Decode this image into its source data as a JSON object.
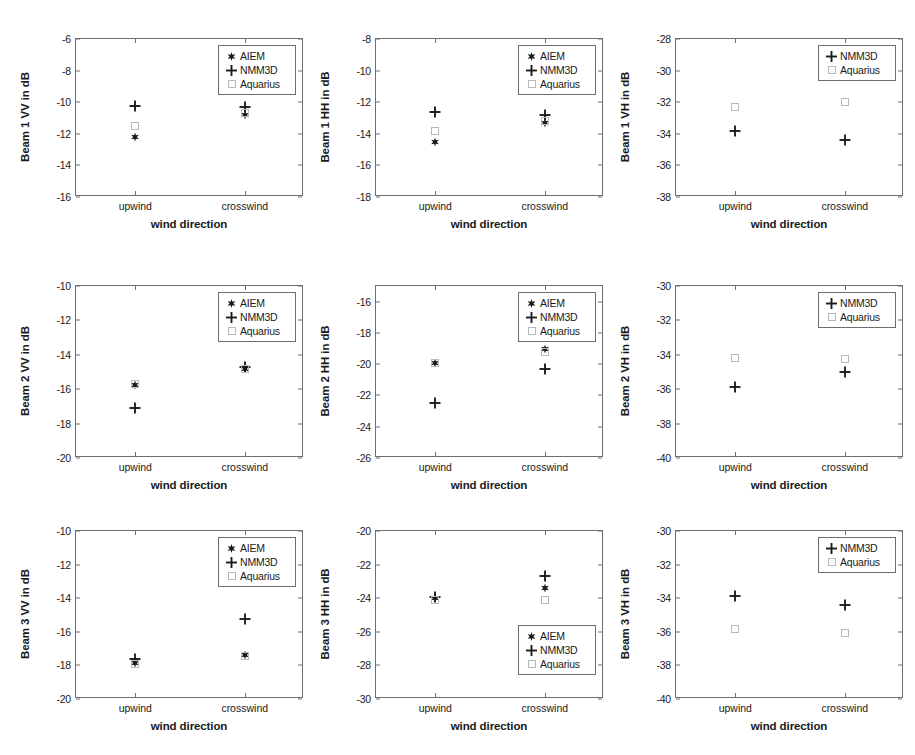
{
  "figure": {
    "xlabel": "wind direction",
    "xticks": [
      "upwind",
      "crosswind"
    ],
    "series_names": [
      "AIEM",
      "NMM3D",
      "Aquarius"
    ],
    "markers": {
      "AIEM": "star-marker",
      "NMM3D": "plus-marker",
      "Aquarius": "open-square-marker"
    },
    "colors": {
      "AIEM": "#1a1a1a",
      "NMM3D": "#1a1a1a",
      "Aquarius": "#b9b9b9",
      "axis": "#6e6e6e"
    }
  },
  "chart_data": [
    {
      "type": "scatter",
      "title": "",
      "ylabel": "Beam 1 VV in dB",
      "xlabel": "wind direction",
      "categories": [
        "upwind",
        "crosswind"
      ],
      "ylim": [
        -16,
        -6
      ],
      "yticks": [
        -6,
        -8,
        -10,
        -12,
        -14,
        -16
      ],
      "grid": false,
      "legend_position": "upper-right",
      "legend": [
        "AIEM",
        "NMM3D",
        "Aquarius"
      ],
      "series": [
        {
          "name": "AIEM",
          "values": [
            -12.2,
            -10.8
          ]
        },
        {
          "name": "NMM3D",
          "values": [
            -10.25,
            -10.3
          ]
        },
        {
          "name": "Aquarius",
          "values": [
            -11.5,
            -10.7
          ]
        }
      ]
    },
    {
      "type": "scatter",
      "title": "",
      "ylabel": "Beam 1 HH in dB",
      "xlabel": "wind direction",
      "categories": [
        "upwind",
        "crosswind"
      ],
      "ylim": [
        -18,
        -8
      ],
      "yticks": [
        -8,
        -10,
        -12,
        -14,
        -16,
        -18
      ],
      "grid": false,
      "legend_position": "upper-right",
      "legend": [
        "AIEM",
        "NMM3D",
        "Aquarius"
      ],
      "series": [
        {
          "name": "AIEM",
          "values": [
            -14.55,
            -13.3
          ]
        },
        {
          "name": "NMM3D",
          "values": [
            -12.65,
            -12.8
          ]
        },
        {
          "name": "Aquarius",
          "values": [
            -13.85,
            -13.2
          ]
        }
      ]
    },
    {
      "type": "scatter",
      "title": "",
      "ylabel": "Beam 1 VH in dB",
      "xlabel": "wind direction",
      "categories": [
        "upwind",
        "crosswind"
      ],
      "ylim": [
        -38,
        -28
      ],
      "yticks": [
        -28,
        -30,
        -32,
        -34,
        -36,
        -38
      ],
      "grid": false,
      "legend_position": "upper-right",
      "legend": [
        "NMM3D",
        "Aquarius"
      ],
      "series": [
        {
          "name": "NMM3D",
          "values": [
            -33.85,
            -34.4
          ]
        },
        {
          "name": "Aquarius",
          "values": [
            -32.3,
            -32.0
          ]
        }
      ]
    },
    {
      "type": "scatter",
      "title": "",
      "ylabel": "Beam 2 VV in dB",
      "xlabel": "wind direction",
      "categories": [
        "upwind",
        "crosswind"
      ],
      "ylim": [
        -20,
        -10
      ],
      "yticks": [
        -10,
        -12,
        -14,
        -16,
        -18,
        -20
      ],
      "grid": false,
      "legend_position": "upper-right",
      "legend": [
        "AIEM",
        "NMM3D",
        "Aquarius"
      ],
      "series": [
        {
          "name": "AIEM",
          "values": [
            -15.75,
            -14.85
          ]
        },
        {
          "name": "NMM3D",
          "values": [
            -17.1,
            -14.7
          ]
        },
        {
          "name": "Aquarius",
          "values": [
            -15.7,
            -14.85
          ]
        }
      ]
    },
    {
      "type": "scatter",
      "title": "",
      "ylabel": "Beam 2 HH in dB",
      "xlabel": "wind direction",
      "categories": [
        "upwind",
        "crosswind"
      ],
      "ylim": [
        -26,
        -15
      ],
      "yticks": [
        -16,
        -18,
        -20,
        -22,
        -24,
        -26
      ],
      "grid": false,
      "legend_position": "upper-right",
      "legend": [
        "AIEM",
        "NMM3D",
        "Aquarius"
      ],
      "series": [
        {
          "name": "AIEM",
          "values": [
            -19.9,
            -19.05
          ]
        },
        {
          "name": "NMM3D",
          "values": [
            -22.5,
            -20.3
          ]
        },
        {
          "name": "Aquarius",
          "values": [
            -19.95,
            -19.2
          ]
        }
      ]
    },
    {
      "type": "scatter",
      "title": "",
      "ylabel": "Beam 2 VH in dB",
      "xlabel": "wind direction",
      "categories": [
        "upwind",
        "crosswind"
      ],
      "ylim": [
        -40,
        -30
      ],
      "yticks": [
        -30,
        -32,
        -34,
        -36,
        -38,
        -40
      ],
      "grid": false,
      "legend_position": "upper-right",
      "legend": [
        "NMM3D",
        "Aquarius"
      ],
      "series": [
        {
          "name": "NMM3D",
          "values": [
            -35.9,
            -35.0
          ]
        },
        {
          "name": "Aquarius",
          "values": [
            -34.2,
            -34.25
          ]
        }
      ]
    },
    {
      "type": "scatter",
      "title": "",
      "ylabel": "Beam 3 VV in dB",
      "xlabel": "wind direction",
      "categories": [
        "upwind",
        "crosswind"
      ],
      "ylim": [
        -20,
        -10
      ],
      "yticks": [
        -10,
        -12,
        -14,
        -16,
        -18,
        -20
      ],
      "grid": false,
      "legend_position": "upper-right",
      "legend": [
        "AIEM",
        "NMM3D",
        "Aquarius"
      ],
      "series": [
        {
          "name": "AIEM",
          "values": [
            -17.85,
            -17.4
          ]
        },
        {
          "name": "NMM3D",
          "values": [
            -17.6,
            -15.25
          ]
        },
        {
          "name": "Aquarius",
          "values": [
            -17.9,
            -17.45
          ]
        }
      ]
    },
    {
      "type": "scatter",
      "title": "",
      "ylabel": "Beam 3 HH in dB",
      "xlabel": "wind direction",
      "categories": [
        "upwind",
        "crosswind"
      ],
      "ylim": [
        -30,
        -20
      ],
      "yticks": [
        -20,
        -22,
        -24,
        -26,
        -28,
        -30
      ],
      "grid": false,
      "legend_position": "lower-right",
      "legend": [
        "AIEM",
        "NMM3D",
        "Aquarius"
      ],
      "series": [
        {
          "name": "AIEM",
          "values": [
            -24.0,
            -23.4
          ]
        },
        {
          "name": "NMM3D",
          "values": [
            -23.9,
            -22.7
          ]
        },
        {
          "name": "Aquarius",
          "values": [
            -24.1,
            -24.1
          ]
        }
      ]
    },
    {
      "type": "scatter",
      "title": "",
      "ylabel": "Beam 3 VH in dB",
      "xlabel": "wind direction",
      "categories": [
        "upwind",
        "crosswind"
      ],
      "ylim": [
        -40,
        -30
      ],
      "yticks": [
        -30,
        -32,
        -34,
        -36,
        -38,
        -40
      ],
      "grid": false,
      "legend_position": "upper-right",
      "legend": [
        "NMM3D",
        "Aquarius"
      ],
      "series": [
        {
          "name": "NMM3D",
          "values": [
            -33.85,
            -34.4
          ]
        },
        {
          "name": "Aquarius",
          "values": [
            -35.85,
            -36.05
          ]
        }
      ]
    }
  ]
}
